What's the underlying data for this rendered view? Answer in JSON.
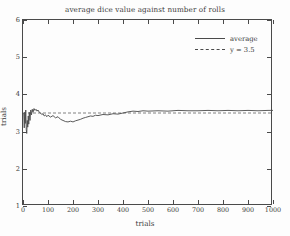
{
  "chart_data": {
    "type": "line",
    "title": "average dice value against number of rolls",
    "xlabel": "trials",
    "ylabel": "trials",
    "xlim": [
      0,
      1000
    ],
    "ylim": [
      1,
      6
    ],
    "xticks": [
      0,
      100,
      200,
      300,
      400,
      500,
      600,
      700,
      800,
      900,
      1000
    ],
    "yticks": [
      1,
      2,
      3,
      4,
      5,
      6
    ],
    "grid": false,
    "legend_position": "top-right",
    "legend": [
      {
        "label": "average",
        "style": "solid",
        "color": "#4a4a4a"
      },
      {
        "label": "y = 3.5",
        "style": "dashed",
        "color": "#4a4a4a"
      }
    ],
    "series": [
      {
        "name": "average",
        "style": "solid",
        "color": "#4a4a4a",
        "x": [
          1,
          3,
          5,
          7,
          9,
          11,
          13,
          15,
          17,
          19,
          21,
          23,
          25,
          28,
          31,
          34,
          37,
          40,
          44,
          48,
          52,
          56,
          60,
          65,
          70,
          75,
          80,
          85,
          90,
          95,
          100,
          110,
          120,
          130,
          140,
          150,
          160,
          170,
          180,
          190,
          200,
          210,
          220,
          230,
          240,
          250,
          260,
          270,
          280,
          290,
          300,
          320,
          340,
          360,
          380,
          400,
          420,
          440,
          460,
          480,
          500,
          540,
          580,
          620,
          660,
          700,
          740,
          780,
          820,
          860,
          900,
          940,
          980,
          1000
        ],
        "y": [
          3.5,
          3.48,
          3.1,
          3.52,
          3.22,
          3.58,
          3.05,
          2.95,
          3.3,
          3.12,
          3.42,
          3.2,
          3.52,
          3.3,
          3.58,
          3.45,
          3.6,
          3.52,
          3.62,
          3.57,
          3.6,
          3.55,
          3.58,
          3.52,
          3.5,
          3.46,
          3.48,
          3.42,
          3.45,
          3.4,
          3.44,
          3.39,
          3.43,
          3.37,
          3.4,
          3.33,
          3.3,
          3.27,
          3.26,
          3.28,
          3.26,
          3.29,
          3.31,
          3.33,
          3.36,
          3.38,
          3.4,
          3.42,
          3.41,
          3.44,
          3.43,
          3.46,
          3.45,
          3.48,
          3.47,
          3.5,
          3.53,
          3.55,
          3.54,
          3.56,
          3.55,
          3.56,
          3.55,
          3.57,
          3.56,
          3.56,
          3.57,
          3.56,
          3.57,
          3.56,
          3.57,
          3.56,
          3.57,
          3.57
        ]
      },
      {
        "name": "y = 3.5",
        "style": "dashed",
        "color": "#4a4a4a",
        "x": [
          0,
          1000
        ],
        "y": [
          3.5,
          3.5
        ]
      }
    ]
  }
}
